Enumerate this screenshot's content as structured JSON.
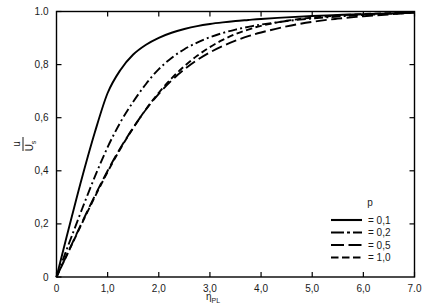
{
  "chart_data": {
    "type": "line",
    "title": "",
    "subtitle": "",
    "xlabel": "ηPL",
    "xlabel_base": "η",
    "xlabel_sub": "PL",
    "ylabel": "u/Uₛ",
    "ylabel_numerator": "u",
    "ylabel_denominator": "U",
    "ylabel_denominator_sub": "s",
    "xlim": [
      0,
      7.0
    ],
    "ylim": [
      0,
      1.0
    ],
    "xticks": [
      0,
      1.0,
      2.0,
      3.0,
      4.0,
      5.0,
      6.0,
      7.0
    ],
    "xticklabels": [
      "0",
      "1,0",
      "2,0",
      "3,0",
      "4,0",
      "5,0",
      "6,0",
      "7.0"
    ],
    "yticks": [
      0,
      0.2,
      0.4,
      0.6,
      0.8,
      1.0
    ],
    "yticklabels": [
      "0",
      "0,2",
      "0,4",
      "0,6",
      "0,8",
      "1.0"
    ],
    "grid": false,
    "legend_position": "lower-right",
    "legend_title": "p",
    "series": [
      {
        "name": "= 0,1",
        "p": 0.1,
        "dash": "solid",
        "color": "#000000",
        "x": [
          0,
          0.15,
          0.3,
          0.5,
          0.75,
          1.0,
          1.25,
          1.5,
          1.75,
          2.0,
          2.25,
          2.5,
          2.75,
          3.0,
          3.25,
          3.5,
          3.75,
          4.0,
          4.5,
          5.0,
          5.5,
          6.0,
          6.5,
          7.0
        ],
        "y": [
          0,
          0.115,
          0.228,
          0.375,
          0.545,
          0.693,
          0.78,
          0.838,
          0.875,
          0.901,
          0.92,
          0.934,
          0.945,
          0.953,
          0.959,
          0.964,
          0.968,
          0.972,
          0.978,
          0.983,
          0.987,
          0.99,
          0.993,
          0.996
        ]
      },
      {
        "name": "= 0,2",
        "p": 0.2,
        "dash": "dash-dot",
        "color": "#000000",
        "x": [
          0,
          0.15,
          0.3,
          0.5,
          0.75,
          1.0,
          1.25,
          1.5,
          1.75,
          2.0,
          2.25,
          2.5,
          2.75,
          3.0,
          3.25,
          3.5,
          3.75,
          4.0,
          4.5,
          5.0,
          5.5,
          6.0,
          6.5,
          7.0
        ],
        "y": [
          0,
          0.078,
          0.155,
          0.256,
          0.378,
          0.489,
          0.583,
          0.66,
          0.727,
          0.783,
          0.825,
          0.858,
          0.883,
          0.903,
          0.919,
          0.932,
          0.942,
          0.951,
          0.964,
          0.974,
          0.981,
          0.987,
          0.991,
          0.996
        ]
      },
      {
        "name": "= 0,5",
        "p": 0.5,
        "dash": "long-dash",
        "color": "#000000",
        "x": [
          0,
          0.15,
          0.3,
          0.5,
          0.75,
          1.0,
          1.25,
          1.5,
          1.75,
          2.0,
          2.25,
          2.5,
          2.75,
          3.0,
          3.25,
          3.5,
          3.75,
          4.0,
          4.5,
          5.0,
          5.5,
          6.0,
          6.5,
          7.0
        ],
        "y": [
          0,
          0.062,
          0.124,
          0.206,
          0.306,
          0.4,
          0.486,
          0.562,
          0.631,
          0.69,
          0.74,
          0.782,
          0.817,
          0.846,
          0.87,
          0.89,
          0.907,
          0.921,
          0.944,
          0.961,
          0.973,
          0.982,
          0.989,
          0.996
        ]
      },
      {
        "name": "= 1,0",
        "p": 1.0,
        "dash": "short-dash",
        "color": "#000000",
        "x": [
          0,
          0.15,
          0.3,
          0.5,
          0.75,
          1.0,
          1.25,
          1.5,
          1.75,
          2.0,
          2.25,
          2.5,
          2.75,
          3.0,
          3.25,
          3.5,
          3.75,
          4.0,
          4.5,
          5.0,
          5.5,
          6.0,
          6.5,
          7.0
        ],
        "y": [
          0,
          0.061,
          0.122,
          0.203,
          0.302,
          0.396,
          0.483,
          0.561,
          0.632,
          0.694,
          0.748,
          0.794,
          0.833,
          0.866,
          0.893,
          0.915,
          0.932,
          0.946,
          0.965,
          0.977,
          0.985,
          0.99,
          0.994,
          0.996
        ]
      }
    ]
  },
  "legend": {
    "title": "p",
    "entries": [
      {
        "label": "= 0,1",
        "style": "solid"
      },
      {
        "label": "= 0,2",
        "style": "dash-dot"
      },
      {
        "label": "= 0,5",
        "style": "long-dash"
      },
      {
        "label": "= 1,0",
        "style": "short-dash"
      }
    ]
  }
}
